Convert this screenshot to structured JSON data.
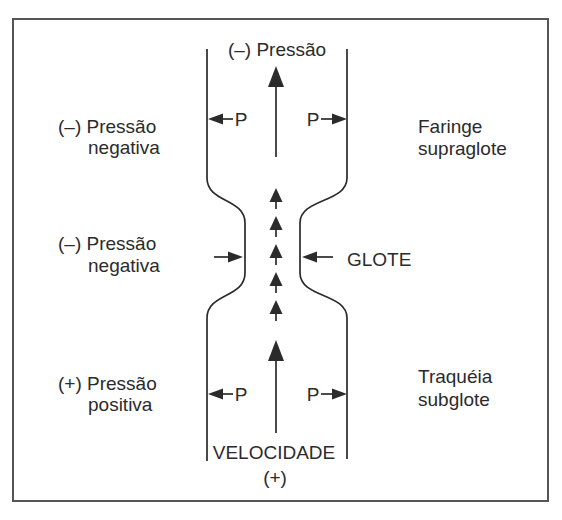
{
  "figure": {
    "background": "#ffffff",
    "ink_color": "#2b2b2b",
    "frame_color": "#555555",
    "top_label": "(–) Pressão",
    "bottom_label_line1": "VELOCIDADE",
    "bottom_label_line2": "(+)",
    "pressure_symbol": "P",
    "left_labels": {
      "supraglottic": {
        "line1": "(–) Pressão",
        "line2": "negativa"
      },
      "glottic": {
        "line1": "(–) Pressão",
        "line2": "negativa"
      },
      "subglottic": {
        "line1": "(+) Pressão",
        "line2": "positiva"
      }
    },
    "right_labels": {
      "supraglottic": {
        "line1": "Faringe",
        "line2": "supraglote"
      },
      "glottic": "GLOTE",
      "subglottic": {
        "line1": "Traquéia",
        "line2": "subglote"
      }
    }
  }
}
